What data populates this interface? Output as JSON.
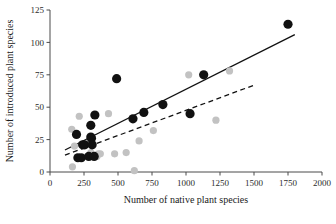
{
  "chart_data": {
    "type": "scatter",
    "title": "",
    "xlabel": "Number of native plant species",
    "ylabel": "Number of introduced plant species",
    "xlim": [
      0,
      2000
    ],
    "ylim": [
      0,
      125
    ],
    "xticks": [
      0,
      250,
      500,
      750,
      1000,
      1250,
      1500,
      1750,
      2000
    ],
    "yticks": [
      0,
      25,
      50,
      75,
      100,
      125
    ],
    "xtick_labels": [
      "0",
      "250",
      "500",
      "750",
      "1000",
      "1250",
      "1500",
      "1750",
      "2000"
    ],
    "ytick_labels": [
      "0",
      "25",
      "50",
      "75",
      "100",
      "125"
    ],
    "grid": false,
    "legend": null,
    "colors": {
      "dark_points": "#111111",
      "light_points": "#c2c2c2",
      "solid_fit": "#111111",
      "dashed_fit": "#111111",
      "axis": "#4a4a4a",
      "background": "#ffffff"
    },
    "series": [
      {
        "name": "dark-points",
        "marker": "filled-circle",
        "color": "#111111",
        "size": 4.6,
        "points": [
          [
            195,
            29
          ],
          [
            205,
            11
          ],
          [
            230,
            11
          ],
          [
            240,
            21
          ],
          [
            255,
            21
          ],
          [
            285,
            12
          ],
          [
            300,
            27
          ],
          [
            305,
            26
          ],
          [
            300,
            36
          ],
          [
            310,
            21
          ],
          [
            325,
            12
          ],
          [
            330,
            44
          ],
          [
            490,
            72
          ],
          [
            610,
            41
          ],
          [
            690,
            46
          ],
          [
            830,
            52
          ],
          [
            1030,
            45
          ],
          [
            1130,
            75
          ],
          [
            1750,
            114
          ]
        ]
      },
      {
        "name": "light-points",
        "marker": "filled-circle",
        "color": "#c2c2c2",
        "size": 3.6,
        "points": [
          [
            160,
            33
          ],
          [
            165,
            4
          ],
          [
            180,
            20
          ],
          [
            215,
            43
          ],
          [
            300,
            15
          ],
          [
            345,
            12
          ],
          [
            355,
            14
          ],
          [
            370,
            14
          ],
          [
            430,
            45
          ],
          [
            475,
            14
          ],
          [
            560,
            15
          ],
          [
            620,
            1
          ],
          [
            655,
            24
          ],
          [
            760,
            32
          ],
          [
            1020,
            75
          ],
          [
            1220,
            40
          ],
          [
            1320,
            78
          ]
        ]
      }
    ],
    "fit_lines": [
      {
        "name": "solid-regression-line",
        "style": "solid",
        "color": "#111111",
        "x_start": 110,
        "y_start": 17,
        "x_end": 1800,
        "y_end": 106
      },
      {
        "name": "dashed-regression-line",
        "style": "dashed",
        "color": "#111111",
        "x_start": 110,
        "y_start": 13,
        "x_end": 1500,
        "y_end": 67
      }
    ]
  }
}
